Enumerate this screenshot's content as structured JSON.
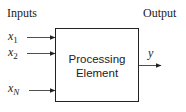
{
  "diagram": {
    "inputs_label": "Inputs",
    "output_label": "Output",
    "box": {
      "line1": "Processing",
      "line2": "Element"
    },
    "inputs": [
      {
        "var": "x",
        "sub": "1"
      },
      {
        "var": "x",
        "sub": "2"
      },
      {
        "var": "x",
        "sub": "N"
      }
    ],
    "output": {
      "var": "y"
    },
    "colors": {
      "stroke": "#222222",
      "background": "#ffffff"
    }
  }
}
